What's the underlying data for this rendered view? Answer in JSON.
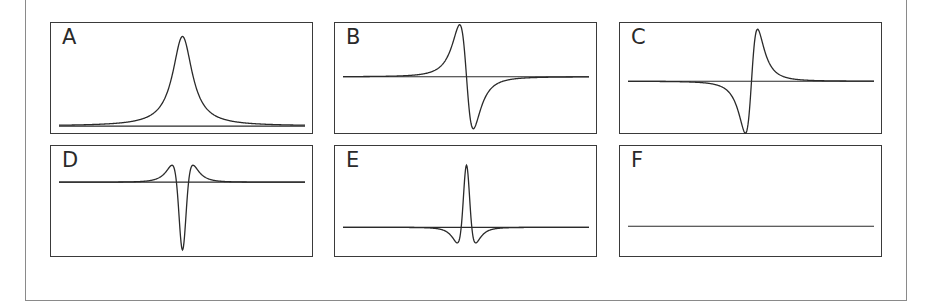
{
  "figure": {
    "panels": [
      {
        "id": "A",
        "label": "A",
        "shape": "absorption",
        "baseline": 0.92,
        "amplitude": 0.8,
        "center": 0.5,
        "width": 0.045
      },
      {
        "id": "B",
        "label": "B",
        "shape": "dispersion",
        "baseline": 0.48,
        "amplitude": 0.55,
        "center": 0.5,
        "width": 0.045
      },
      {
        "id": "C",
        "label": "C",
        "shape": "dispersion-inverted",
        "baseline": 0.52,
        "amplitude": 0.55,
        "center": 0.5,
        "width": 0.04
      },
      {
        "id": "D",
        "label": "D",
        "shape": "second-derivative-inverted",
        "baseline": 0.32,
        "amplitude": 0.6,
        "center": 0.5,
        "width": 0.04
      },
      {
        "id": "E",
        "label": "E",
        "shape": "second-derivative",
        "baseline": 0.72,
        "amplitude": 0.55,
        "center": 0.5,
        "width": 0.035
      },
      {
        "id": "F",
        "label": "F",
        "shape": "flat",
        "baseline": 0.71,
        "amplitude": 0,
        "center": 0.5,
        "width": 0.04
      }
    ]
  },
  "colors": {
    "line": "#2a2a2a",
    "frame": "#8a8a8a",
    "panel_border": "#3a3a3a"
  }
}
